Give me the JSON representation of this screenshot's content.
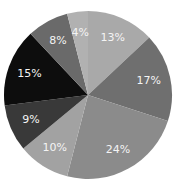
{
  "chart_data": {
    "type": "pie",
    "title": "",
    "start_angle_deg": 0,
    "direction": "clockwise",
    "categories": [
      "Slice 1",
      "Slice 2",
      "Slice 3",
      "Slice 4",
      "Slice 5",
      "Slice 6",
      "Slice 7",
      "Slice 8"
    ],
    "values": [
      13,
      17,
      24,
      10,
      9,
      15,
      8,
      4
    ],
    "labels": [
      "13%",
      "17%",
      "24%",
      "10%",
      "9%",
      "15%",
      "8%",
      "4%"
    ],
    "colors": [
      "#a9a9a9",
      "#6f6f6f",
      "#8b8b8b",
      "#a2a2a2",
      "#393939",
      "#0d0d0d",
      "#6a6a6a",
      "#b1b1b1"
    ],
    "legend": "none"
  }
}
